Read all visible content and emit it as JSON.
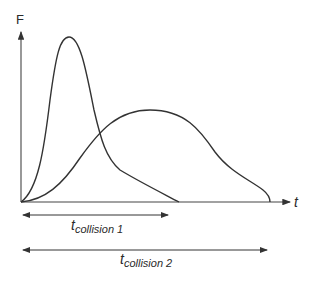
{
  "diagram": {
    "y_axis_label": "F",
    "x_axis_label": "t",
    "curves": [
      {
        "name": "collision 1",
        "shape": "tall narrow peak",
        "duration_label": "collision 1"
      },
      {
        "name": "collision 2",
        "shape": "low broad peak",
        "duration_label": "collision 2"
      }
    ],
    "duration_arrows": [
      {
        "symbol": "t",
        "subscript": "collision 1"
      },
      {
        "symbol": "t",
        "subscript": "collision 2"
      }
    ],
    "colors": {
      "line": "#333333",
      "background": "#ffffff"
    }
  }
}
